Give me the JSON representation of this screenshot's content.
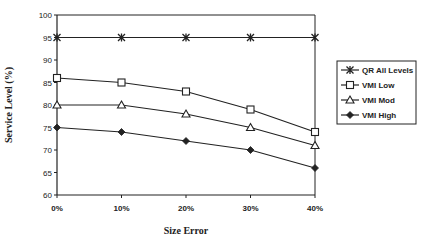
{
  "chart_data": {
    "type": "line",
    "title": "",
    "xlabel": "Size Error",
    "ylabel": "Service Level (%)",
    "x": [
      "0%",
      "10%",
      "20%",
      "30%",
      "40%"
    ],
    "ylim": [
      60,
      100
    ],
    "yticks": [
      60,
      65,
      70,
      75,
      80,
      85,
      90,
      95,
      100
    ],
    "ytick_labels": [
      "60",
      "65",
      "70",
      "75",
      "80",
      "85",
      "90",
      "95",
      "100"
    ],
    "grid": false,
    "legend_position": "right",
    "series": [
      {
        "name": "QR All Levels",
        "marker": "asterisk",
        "values": [
          95,
          95,
          95,
          95,
          95
        ]
      },
      {
        "name": "VMI Low",
        "marker": "square",
        "values": [
          86,
          85,
          83,
          79,
          74
        ]
      },
      {
        "name": "VMI Mod",
        "marker": "triangle",
        "values": [
          80,
          80,
          78,
          75,
          71
        ]
      },
      {
        "name": "VMI High",
        "marker": "diamond",
        "values": [
          75,
          74,
          72,
          70,
          66
        ]
      }
    ]
  }
}
